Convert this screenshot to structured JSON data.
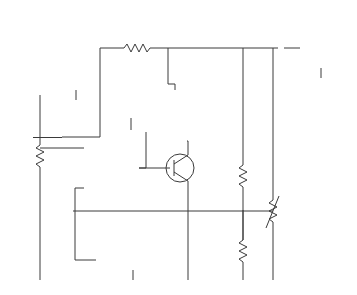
{
  "figure": {
    "meters": [
      {
        "id": "vin",
        "caption": "Increases",
        "label": "V_IN"
      },
      {
        "id": "vb",
        "caption": "Increases",
        "label": "V_B"
      },
      {
        "id": "ib",
        "caption": "Increases",
        "label": "I_B"
      },
      {
        "id": "vout",
        "caption": "",
        "label": "V_OUT"
      },
      {
        "id": "vfb",
        "caption": "Increases",
        "label": "V_FB"
      }
    ],
    "labels": {
      "vin": "V",
      "vin_sub": "IN",
      "r1": "R",
      "r1_sub": "1",
      "r2": "R",
      "r2_sub": "2",
      "r3": "R",
      "r3_sub": "3",
      "r4": "R",
      "r4_sub": "4",
      "rl": "R",
      "rl_sub": "L",
      "q1": "Q",
      "q1_sub": "1",
      "rce": "r'",
      "rce_sub": "CE",
      "opamp_minus": "−",
      "opamp_plus": "+"
    },
    "colors": {
      "wire": "#333333",
      "opamp_fill": "#efe9c8",
      "arrow": "#c0283a",
      "meter_body": "#3a6db3",
      "teal_wire": "#2aa39a"
    }
  }
}
